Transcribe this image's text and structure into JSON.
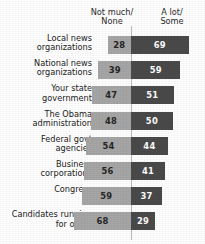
{
  "chart_data": {
    "type": "bar",
    "subtype": "diverging-stacked-bar",
    "title": "",
    "xlabel": "",
    "ylabel": "",
    "grid": false,
    "legend_position": "top",
    "axis_divider_at": 0,
    "units": "percent",
    "categories": [
      "Local news organizations",
      "National news organizations",
      "Your state government",
      "The Obama administration",
      "Federal govt agencies",
      "Business corporations",
      "Congress",
      "Candidates running for office"
    ],
    "series": [
      {
        "name": "Not much/ None",
        "side": "left",
        "color": "#a6a6a6",
        "values": [
          28,
          39,
          47,
          48,
          54,
          56,
          59,
          68
        ]
      },
      {
        "name": "A lot/ Some",
        "side": "right",
        "color": "#4a4a4a",
        "values": [
          69,
          59,
          51,
          50,
          44,
          41,
          37,
          29
        ]
      }
    ]
  },
  "headers": {
    "left": {
      "line1": "Not much/",
      "line2": "None"
    },
    "right": {
      "line1": "A lot/",
      "line2": "Some"
    }
  },
  "rows": [
    {
      "label_line1": "Local news",
      "label_line2": "organizations",
      "left": "28",
      "right": "69"
    },
    {
      "label_line1": "National news",
      "label_line2": "organizations",
      "left": "39",
      "right": "59"
    },
    {
      "label_line1": "Your state",
      "label_line2": "government",
      "left": "47",
      "right": "51"
    },
    {
      "label_line1": "The Obama",
      "label_line2": "administration",
      "left": "48",
      "right": "50"
    },
    {
      "label_line1": "Federal govt",
      "label_line2": "agencies",
      "left": "54",
      "right": "44"
    },
    {
      "label_line1": "Business",
      "label_line2": "corporations",
      "left": "56",
      "right": "41"
    },
    {
      "label_line1": "Congress",
      "label_line2": "",
      "left": "59",
      "right": "37"
    },
    {
      "label_line1": "Candidates running",
      "label_line2": "for office",
      "left": "68",
      "right": "29"
    }
  ],
  "colors": {
    "left_bar": "#a6a6a6",
    "right_bar": "#4a4a4a",
    "divider": "#bcbcbc",
    "background": "#ffffff",
    "text": "#222222"
  }
}
